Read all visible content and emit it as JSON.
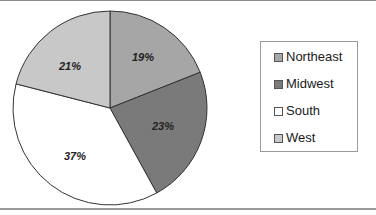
{
  "chart_data": {
    "type": "pie",
    "title": "",
    "categories": [
      "Northeast",
      "Midwest",
      "South",
      "West"
    ],
    "values": [
      19,
      23,
      37,
      21
    ],
    "labels": [
      "19%",
      "23%",
      "37%",
      "21%"
    ],
    "colors": [
      "#a6a6a6",
      "#7a7a7a",
      "#ffffff",
      "#c8c8c8"
    ],
    "start_angle_deg": 0,
    "direction": "clockwise",
    "legend_position": "right"
  },
  "legend": {
    "items": [
      {
        "label": "Northeast",
        "color": "#a6a6a6"
      },
      {
        "label": "Midwest",
        "color": "#7a7a7a"
      },
      {
        "label": "South",
        "color": "#ffffff"
      },
      {
        "label": "West",
        "color": "#c8c8c8"
      }
    ]
  },
  "slices": [
    {
      "label": "19%"
    },
    {
      "label": "23%"
    },
    {
      "label": "37%"
    },
    {
      "label": "21%"
    }
  ]
}
